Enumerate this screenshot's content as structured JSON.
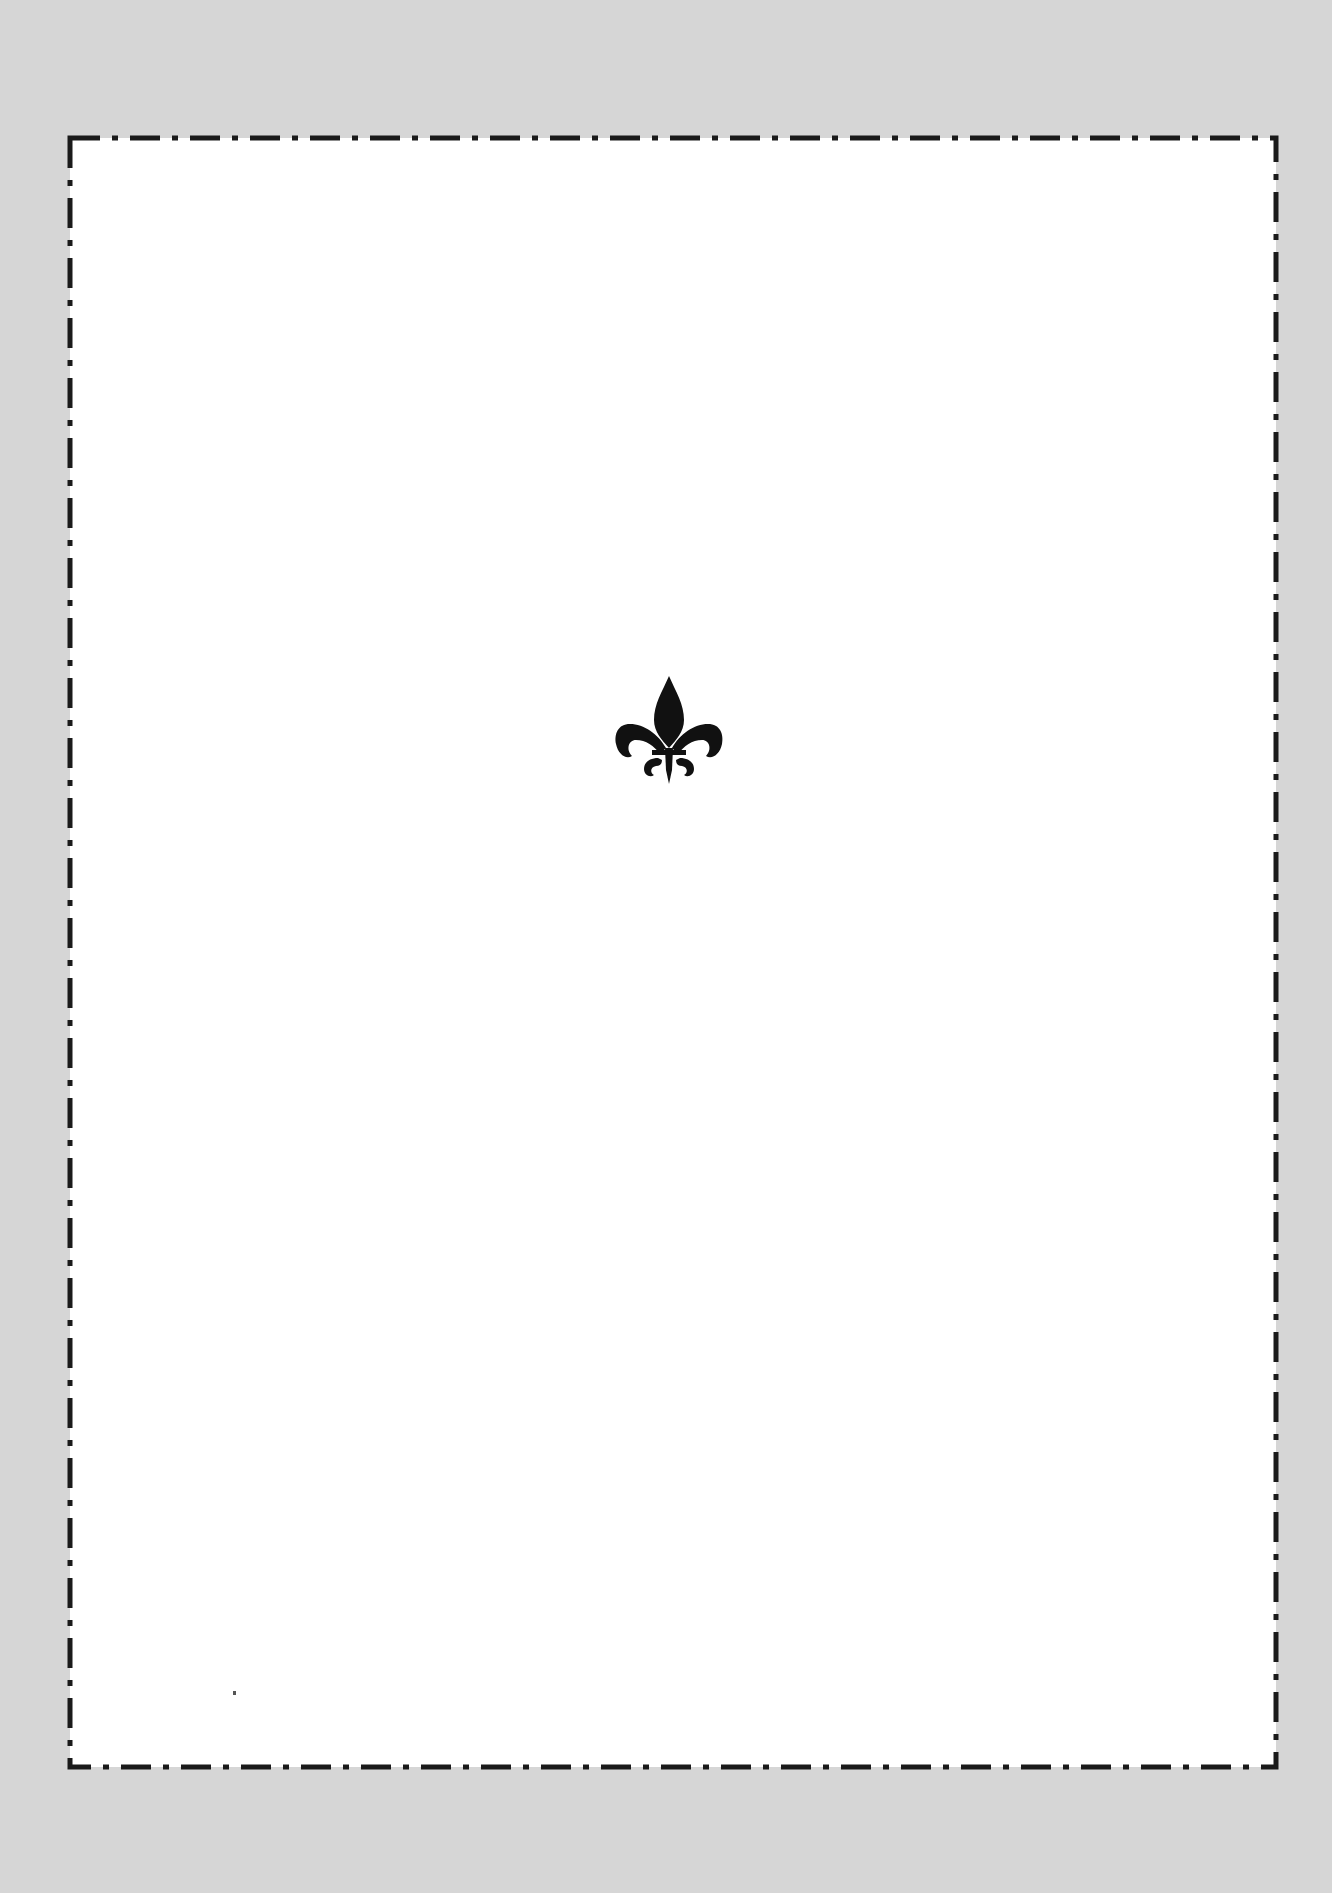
{
  "page": {
    "kind": "ornamental-page",
    "ornament": {
      "icon": "fleur-de-lis-icon",
      "color": "#111111"
    },
    "border": {
      "style": "dash-dot",
      "color": "#1a1a1a"
    },
    "background_color": "#d6d6d6",
    "paper_color": "#ffffff"
  }
}
